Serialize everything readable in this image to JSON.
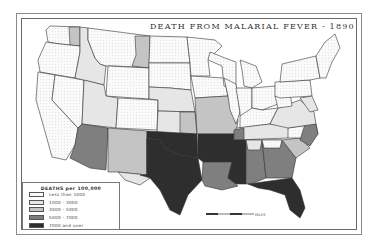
{
  "title": "DEATH FROM MALARIAL FEVER - 1890",
  "legend": {
    "title": "DEATHS per 100,000",
    "classes": [
      {
        "label": "Less than 1000",
        "color": "#fafafa",
        "pattern": "dots"
      },
      {
        "label": "1000 - 3000",
        "color": "#e6e6e6"
      },
      {
        "label": "3000 - 5000",
        "color": "#c4c4c4"
      },
      {
        "label": "5000 - 7000",
        "color": "#7f7f7f"
      },
      {
        "label": "7000 and over",
        "color": "#2e2e2e"
      }
    ]
  },
  "scale": {
    "unit_label": "MILES"
  },
  "regions": [
    {
      "name": "washington",
      "class": 0,
      "points": "50,26 80,27 80,46 60,44 48,42 46,30"
    },
    {
      "name": "washington-east",
      "class": 2,
      "points": "69,27 80,27 80,46 70,45"
    },
    {
      "name": "oregon",
      "class": 0,
      "points": "46,42 60,44 80,46 80,52 75,78 40,72 38,60"
    },
    {
      "name": "california",
      "class": 0,
      "points": "38,72 55,75 52,100 78,128 75,145 66,160 52,157 44,128 36,100"
    },
    {
      "name": "nevada",
      "class": 0,
      "points": "55,75 84,80 82,124 78,128 52,100"
    },
    {
      "name": "idaho",
      "class": 1,
      "points": "80,27 88,28 88,40 95,58 100,64 106,66 104,85 75,78 80,52"
    },
    {
      "name": "montana",
      "class": 0,
      "points": "88,28 150,36 149,68 116,66 106,66 100,64 95,58 88,40"
    },
    {
      "name": "montana-east",
      "class": 2,
      "points": "135,36 150,36 149,68 132,66 136,55"
    },
    {
      "name": "wyoming",
      "class": 0,
      "points": "108,66 149,68 149,99 106,96"
    },
    {
      "name": "utah",
      "class": 1,
      "points": "84,80 104,85 106,96 118,98 116,128 82,124"
    },
    {
      "name": "colorado",
      "class": 0,
      "points": "118,98 158,100 157,130 116,128"
    },
    {
      "name": "arizona",
      "class": 3,
      "points": "82,124 108,128 106,170 90,168 70,158 75,145 78,128"
    },
    {
      "name": "new-mexico",
      "class": 2,
      "points": "108,128 147,131 147,175 118,172 108,172"
    },
    {
      "name": "north-dakota",
      "class": 0,
      "points": "150,36 187,37 190,63 149,63"
    },
    {
      "name": "south-dakota",
      "class": 0,
      "points": "149,63 190,63 191,90 170,88 149,87"
    },
    {
      "name": "nebraska",
      "class": 1,
      "points": "149,87 170,88 191,90 195,112 158,111 158,100 149,99"
    },
    {
      "name": "kansas",
      "class": 1,
      "points": "158,111 195,112 197,134 157,133"
    },
    {
      "name": "kansas-east",
      "class": 2,
      "points": "180,112 195,112 197,134 180,133"
    },
    {
      "name": "oklahoma",
      "class": 4,
      "points": "147,131 197,134 198,158 180,155 165,148 160,140 147,138"
    },
    {
      "name": "texas",
      "class": 4,
      "points": "147,138 160,140 165,148 180,155 198,158 202,180 188,195 180,215 170,210 160,190 150,178 140,175 147,175"
    },
    {
      "name": "texas-west",
      "class": 1,
      "points": "118,172 147,175 147,138 147,175 140,175 150,178 140,185 125,180"
    },
    {
      "name": "minnesota",
      "class": 0,
      "points": "187,37 215,40 222,46 208,60 210,76 191,76 190,63"
    },
    {
      "name": "iowa",
      "class": 0,
      "points": "191,76 224,78 228,96 195,98"
    },
    {
      "name": "missouri",
      "class": 2,
      "points": "195,98 228,96 238,120 236,134 197,134"
    },
    {
      "name": "arkansas",
      "class": 4,
      "points": "198,134 234,134 232,162 203,162 198,158"
    },
    {
      "name": "louisiana",
      "class": 3,
      "points": "203,162 232,162 228,178 238,186 222,190 205,186 202,180"
    },
    {
      "name": "wisconsin",
      "class": 0,
      "points": "210,52 225,58 236,62 236,88 224,86 222,66 208,60"
    },
    {
      "name": "illinois",
      "class": 0,
      "points": "224,78 236,84 240,112 236,124 230,110 228,96"
    },
    {
      "name": "michigan",
      "class": 0,
      "points": "240,60 256,66 262,82 252,88 244,86 242,70"
    },
    {
      "name": "indiana",
      "class": 0,
      "points": "236,88 252,88 252,112 240,116 240,112"
    },
    {
      "name": "ohio",
      "class": 0,
      "points": "252,88 275,86 278,104 262,110 252,108"
    },
    {
      "name": "kentucky",
      "class": 0,
      "points": "240,116 252,108 262,110 278,108 270,124 240,128"
    },
    {
      "name": "tennessee",
      "class": 1,
      "points": "236,128 270,124 292,124 288,138 236,140"
    },
    {
      "name": "tennessee-west",
      "class": 3,
      "points": "234,130 244,128 244,140 234,140"
    },
    {
      "name": "mississippi",
      "class": 4,
      "points": "232,140 246,140 246,184 236,184 228,178 232,162"
    },
    {
      "name": "alabama",
      "class": 3,
      "points": "246,140 262,140 266,178 256,182 248,184 246,184"
    },
    {
      "name": "alabama-north",
      "class": 1,
      "points": "246,140 262,140 260,150 248,150"
    },
    {
      "name": "georgia",
      "class": 3,
      "points": "262,140 282,140 296,158 292,178 266,178"
    },
    {
      "name": "georgia-north",
      "class": 0,
      "points": "262,140 282,140 280,148 264,148"
    },
    {
      "name": "florida",
      "class": 4,
      "points": "248,184 292,178 300,190 305,208 300,218 290,210 285,195 270,190 258,188"
    },
    {
      "name": "south-carolina",
      "class": 2,
      "points": "282,140 300,138 310,148 296,158"
    },
    {
      "name": "north-carolina",
      "class": 0,
      "points": "288,128 316,124 318,134 310,140 300,138 288,138"
    },
    {
      "name": "north-carolina-coast",
      "class": 3,
      "points": "305,124 316,124 318,134 310,146 300,140"
    },
    {
      "name": "virginia",
      "class": 1,
      "points": "278,108 300,100 314,112 316,124 288,128 270,124"
    },
    {
      "name": "west-virginia",
      "class": 0,
      "points": "275,96 290,92 292,106 278,108"
    },
    {
      "name": "pennsylvania",
      "class": 0,
      "points": "275,82 310,80 312,96 280,98 275,96"
    },
    {
      "name": "new-york",
      "class": 0,
      "points": "282,64 316,56 320,78 310,80 280,82"
    },
    {
      "name": "new-england",
      "class": 0,
      "points": "316,56 325,42 335,34 340,48 332,62 326,78 320,78"
    },
    {
      "name": "maryland-delaware",
      "class": 1,
      "points": "300,98 312,96 318,110 310,112"
    }
  ]
}
